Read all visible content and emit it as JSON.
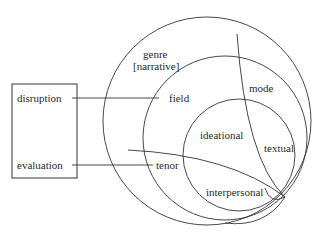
{
  "diagram": {
    "context_box": {
      "items": [
        "disruption",
        "evaluation"
      ]
    },
    "circles": {
      "outer": {
        "label_line1": "genre",
        "label_line2": "[narrative]"
      },
      "middle": {
        "field_label": "field",
        "tenor_label": "tenor",
        "mode_label": "mode"
      },
      "inner": {
        "ideational_label": "ideational",
        "textual_label": "textual",
        "interpersonal_label": "interpersonal"
      }
    },
    "colors": {
      "stroke": "#333333",
      "text": "#2a2a2a",
      "background": "#ffffff"
    }
  }
}
